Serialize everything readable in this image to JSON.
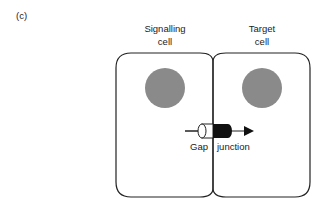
{
  "panel_label": "(c)",
  "cells": {
    "left": {
      "line1": "Signalling",
      "line2": "cell"
    },
    "right": {
      "line1": "Target",
      "line2": "cell"
    }
  },
  "junction": {
    "label_left": "Gap",
    "label_right": "junction"
  },
  "colors": {
    "outline": "#222222",
    "nucleus": "#8a8a8a",
    "channel": "#111111"
  }
}
